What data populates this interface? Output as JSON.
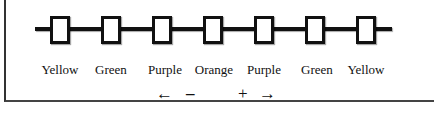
{
  "diagram": {
    "beads": [
      {
        "label": "Yellow",
        "x": 50
      },
      {
        "label": "Green",
        "x": 101
      },
      {
        "label": "Purple",
        "x": 152
      },
      {
        "label": "Orange",
        "x": 203
      },
      {
        "label": "Purple",
        "x": 254
      },
      {
        "label": "Green",
        "x": 305
      },
      {
        "label": "Yellow",
        "x": 356
      }
    ]
  },
  "controls": {
    "left_arrow": "←",
    "minus": "–",
    "plus": "+",
    "right_arrow": "→"
  }
}
